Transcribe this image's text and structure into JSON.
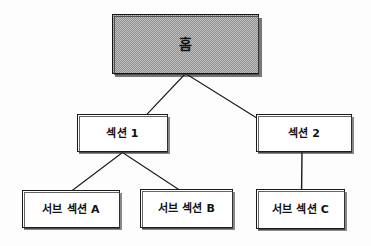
{
  "diagram": {
    "type": "sitemap-tree",
    "style": "hand-drawn-sketch",
    "background_color": "#fdfdfd",
    "root_fill_color": "#c2c2c2",
    "line_color": "#1a1a1a",
    "text_color": "#111111",
    "nodes": [
      {
        "id": "home",
        "label": "홈",
        "level": 0
      },
      {
        "id": "section-1",
        "label": "섹션 1",
        "level": 1
      },
      {
        "id": "section-2",
        "label": "섹션 2",
        "level": 1
      },
      {
        "id": "sub-a",
        "label": "서브 섹션 A",
        "level": 2
      },
      {
        "id": "sub-b",
        "label": "서브 섹션 B",
        "level": 2
      },
      {
        "id": "sub-c",
        "label": "서브 섹션 C",
        "level": 2
      }
    ],
    "edges": [
      {
        "from": "home",
        "to": "section-1"
      },
      {
        "from": "home",
        "to": "section-2"
      },
      {
        "from": "section-1",
        "to": "sub-a"
      },
      {
        "from": "section-1",
        "to": "sub-b"
      },
      {
        "from": "section-2",
        "to": "sub-c"
      }
    ]
  }
}
